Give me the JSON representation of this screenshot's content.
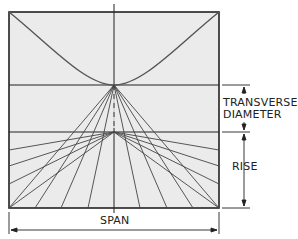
{
  "diagram": {
    "labels": {
      "transverse_line1": "TRANSVERSE",
      "transverse_line2": "DIAMETER",
      "rise": "RISE",
      "span": "SPAN"
    },
    "colors": {
      "background": "#ffffff",
      "panel": "#ebebeb",
      "stroke": "#222222",
      "curve": "#555555",
      "fan": "#444444"
    }
  }
}
